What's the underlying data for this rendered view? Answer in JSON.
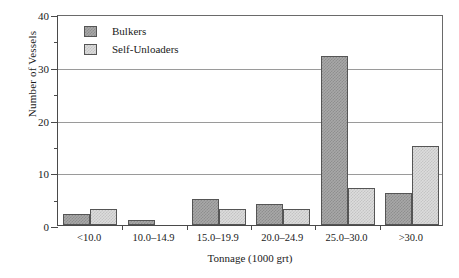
{
  "chart_data": {
    "type": "bar",
    "title": "",
    "subtitle": "",
    "xlabel": "Tonnage (1000 grt)",
    "ylabel": "Number of Vessels",
    "categories": [
      "<10.0",
      "10.0–14.9",
      "15.0–19.9",
      "20.0–24.9",
      "25.0–30.0",
      ">30.0"
    ],
    "series": [
      {
        "name": "Bulkers",
        "values": [
          2,
          1,
          5,
          4,
          32,
          6
        ],
        "color": "#a8a8a8"
      },
      {
        "name": "Self-Unloaders",
        "values": [
          3,
          0,
          3,
          3,
          7,
          15
        ],
        "color": "#dcdcdc"
      }
    ],
    "ylim": [
      0,
      40
    ],
    "y_major_ticks": [
      0,
      10,
      20,
      30,
      40
    ],
    "y_tick_labels": [
      "0",
      "10",
      "20",
      "30",
      "40"
    ],
    "y_minor_ticks": [
      5,
      15,
      25,
      35
    ],
    "grid": true,
    "grid_axis": "y",
    "legend_position": "top-left",
    "axis_color": "#4a4a4a",
    "grid_color": "#9a9a9a",
    "background": "#ffffff"
  }
}
